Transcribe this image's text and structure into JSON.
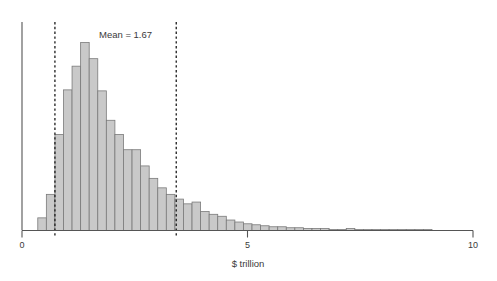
{
  "chart_data": {
    "type": "bar",
    "title": "",
    "subtitle": "",
    "xlabel": "$ trillion",
    "ylabel": "",
    "xlim": [
      0,
      10
    ],
    "ylim": [
      0,
      1
    ],
    "grid": false,
    "legend": null,
    "bin_width": 0.19,
    "bin_starts": [
      0.35,
      0.54,
      0.73,
      0.92,
      1.11,
      1.3,
      1.49,
      1.68,
      1.87,
      2.06,
      2.25,
      2.44,
      2.63,
      2.82,
      3.01,
      3.2,
      3.39,
      3.58,
      3.77,
      3.96,
      4.15,
      4.34,
      4.53,
      4.72,
      4.91,
      5.1,
      5.29,
      5.48,
      5.67,
      5.86,
      6.05,
      6.24,
      6.43,
      6.62,
      6.81,
      7.0,
      7.19,
      7.38,
      7.57,
      7.76,
      7.95,
      8.14,
      8.33,
      8.52,
      8.71,
      8.9
    ],
    "categories": [
      "0.35",
      "0.54",
      "0.73",
      "0.92",
      "1.11",
      "1.30",
      "1.49",
      "1.68",
      "1.87",
      "2.06",
      "2.25",
      "2.44",
      "2.63",
      "2.82",
      "3.01",
      "3.20",
      "3.39",
      "3.58",
      "3.77",
      "3.96",
      "4.15",
      "4.34",
      "4.53",
      "4.72",
      "4.91",
      "5.10",
      "5.29",
      "5.48",
      "5.67",
      "5.86",
      "6.05",
      "6.24",
      "6.43",
      "6.62",
      "6.81",
      "7.00",
      "7.19",
      "7.38",
      "7.57",
      "7.76",
      "7.95",
      "8.14",
      "8.33",
      "8.52",
      "8.71",
      "8.90"
    ],
    "values": [
      0.064,
      0.183,
      0.486,
      0.712,
      0.832,
      0.952,
      0.87,
      0.707,
      0.558,
      0.486,
      0.409,
      0.409,
      0.327,
      0.264,
      0.216,
      0.183,
      0.159,
      0.135,
      0.144,
      0.096,
      0.082,
      0.072,
      0.053,
      0.043,
      0.034,
      0.029,
      0.024,
      0.019,
      0.019,
      0.014,
      0.014,
      0.01,
      0.01,
      0.01,
      0.005,
      0.005,
      0.01,
      0.005,
      0.005,
      0.005,
      0.005,
      0.005,
      0.005,
      0.005,
      0.005,
      0.005
    ],
    "xticks": [
      0,
      5,
      10
    ],
    "xtick_labels": [
      "0",
      "5",
      "10"
    ],
    "annotations": [
      {
        "name": "mean-label",
        "text": "Mean = 1.67",
        "x": 1.67
      }
    ],
    "vlines": [
      {
        "name": "lower-bound",
        "x": 0.73,
        "style": "dashed"
      },
      {
        "name": "upper-bound",
        "x": 3.42,
        "style": "dashed"
      }
    ],
    "colors": {
      "bar_fill": "#c9c9c9",
      "bar_edge": "#7a7a7a",
      "axis": "#555555",
      "vline": "#1a1a1a",
      "text": "#3a3a3a"
    }
  }
}
